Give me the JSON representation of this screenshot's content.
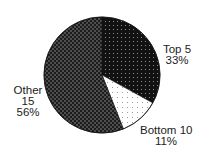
{
  "chart_data": {
    "type": "pie",
    "title": "",
    "start_angle": "12 o'clock",
    "direction": "clockwise",
    "slices": [
      {
        "label": "Top 5",
        "value": 33,
        "value_label": "33%",
        "pattern": "dark-dots"
      },
      {
        "label": "Bottom 10",
        "value": 11,
        "value_label": "11%",
        "pattern": "white-dots"
      },
      {
        "label": "Other 15",
        "value": 56,
        "value_label": "56%",
        "pattern": "dark-checker"
      }
    ],
    "categories": [
      "Top 5",
      "Bottom 10",
      "Other 15"
    ],
    "values": [
      33,
      11,
      56
    ],
    "legend": "none (direct labels)"
  },
  "labels": {
    "top5": {
      "line1": "Top 5",
      "line2": "33%"
    },
    "bottom10": {
      "line1": "Bottom 10",
      "line2": "11%"
    },
    "other": {
      "line1": "Other",
      "line2": "15",
      "line3": "56%"
    }
  },
  "colors": {
    "background": "#ffffff",
    "dark_fill": "#121212",
    "dark_dot": "#8a8a8a",
    "checker_dark": "#1c1c1c",
    "checker_light": "#4e4e4e",
    "light_fill": "#ffffff",
    "light_dot": "#9a9a9a",
    "text": "#222222"
  }
}
